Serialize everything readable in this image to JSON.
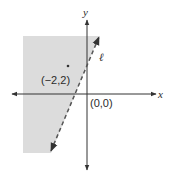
{
  "diagram": {
    "type": "half-plane graph",
    "axes": {
      "x_label": "x",
      "y_label": "y"
    },
    "line": {
      "label": "ℓ",
      "style": "dashed",
      "color": "#555555"
    },
    "shaded_region": {
      "side": "left of line",
      "color": "#dcdcdc"
    },
    "points": [
      {
        "label": "(−2,2)",
        "marked": true
      },
      {
        "label": "(0,0)",
        "marked": false
      }
    ]
  }
}
